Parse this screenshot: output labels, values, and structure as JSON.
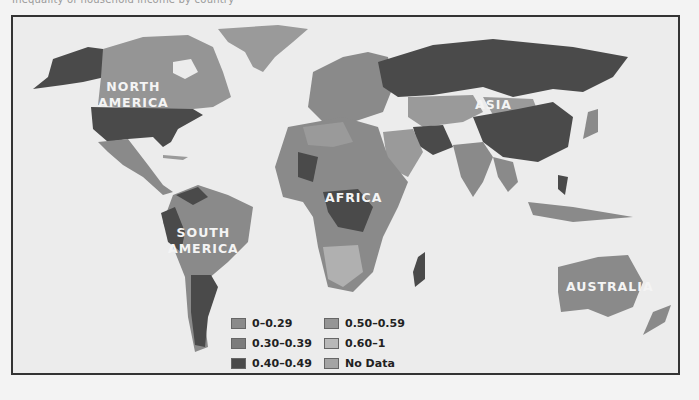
{
  "caption": "Inequality of household income by country",
  "map": {
    "title": "World income inequality map",
    "continent_labels": {
      "north_america": [
        "NORTH",
        "AMERICA"
      ],
      "south_america": [
        "SOUTH",
        "AMERICA"
      ],
      "africa": "AFRICA",
      "asia": "ASIA",
      "australia": "AUSTRALIA"
    },
    "legend": [
      {
        "label": "0–0.29",
        "color": "#8a8a8a"
      },
      {
        "label": "0.30–0.39",
        "color": "#7c7c7c"
      },
      {
        "label": "0.40–0.49",
        "color": "#4a4a4a"
      },
      {
        "label": "0.50–0.59",
        "color": "#959595"
      },
      {
        "label": "0.60–1",
        "color": "#b8b8b8"
      },
      {
        "label": "No Data",
        "color": "#a4a4a4"
      }
    ],
    "colors": {
      "ocean": "#ececec",
      "frame": "#333333",
      "dark": "#4a4a4a",
      "mid": "#8a8a8a",
      "midlight": "#9a9a9a",
      "light": "#b0b0b0"
    }
  }
}
